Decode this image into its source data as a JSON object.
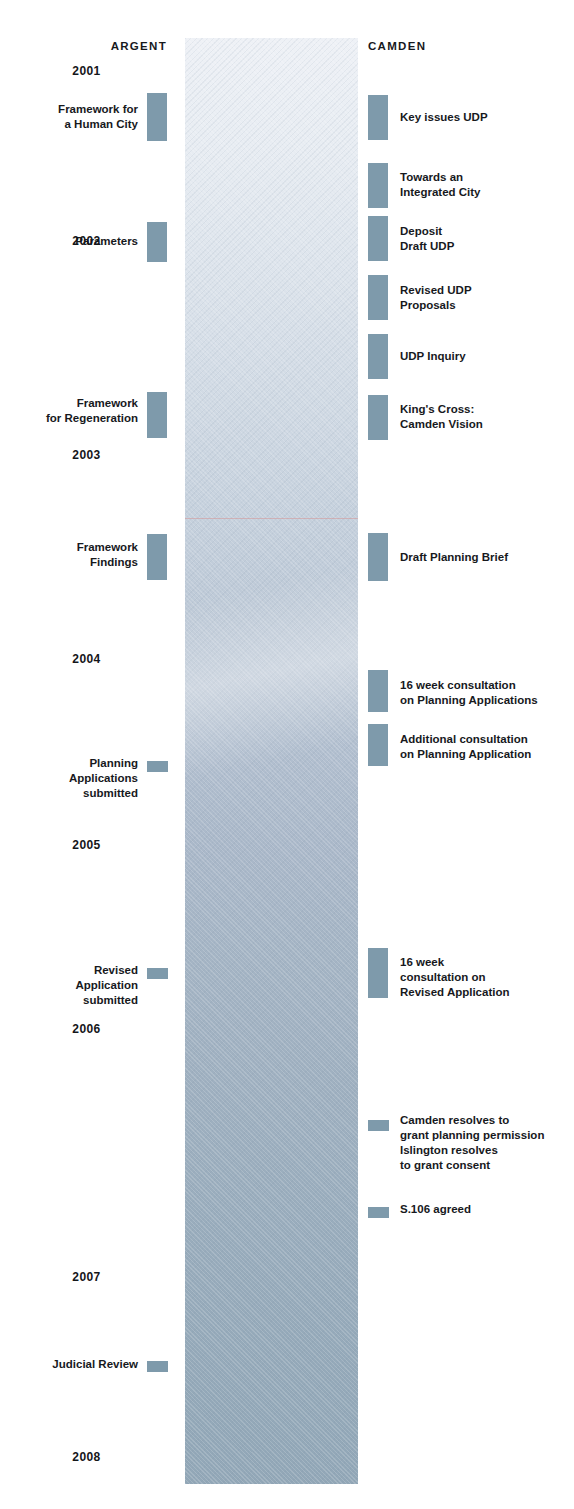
{
  "diagram": {
    "columns": {
      "left_heading": "ARGENT",
      "right_heading": "CAMDEN"
    },
    "colors": {
      "marker": "#7e9aab",
      "text": "#17191d",
      "column_top": "#eef1f6",
      "column_bottom": "#92a7b7",
      "scan_line": "#d69696"
    },
    "years": [
      {
        "label": "2001",
        "top": 64
      },
      {
        "label": "2002",
        "top": 234
      },
      {
        "label": "2003",
        "top": 448
      },
      {
        "label": "2004",
        "top": 652
      },
      {
        "label": "2005",
        "top": 838
      },
      {
        "label": "2006",
        "top": 1022
      },
      {
        "label": "2007",
        "top": 1270
      },
      {
        "label": "2008",
        "top": 1450
      }
    ],
    "argent_events": [
      {
        "label": "Framework for\na Human City",
        "marker_top": 93,
        "marker_height": 48,
        "label_top": 102,
        "size": "tall"
      },
      {
        "label": "Parameters",
        "marker_top": 222,
        "marker_height": 40,
        "label_top": 234,
        "size": "tall"
      },
      {
        "label": "Framework\nfor Regeneration",
        "marker_top": 392,
        "marker_height": 46,
        "label_top": 396,
        "size": "tall"
      },
      {
        "label": "Framework\nFindings",
        "marker_top": 534,
        "marker_height": 46,
        "label_top": 540,
        "size": "tall"
      },
      {
        "label": "Planning\nApplications\nsubmitted",
        "marker_top": 761,
        "marker_height": 11,
        "label_top": 756,
        "size": "short"
      },
      {
        "label": "Revised\nApplication\nsubmitted",
        "marker_top": 968,
        "marker_height": 11,
        "label_top": 963,
        "size": "short"
      },
      {
        "label": "Judicial Review",
        "marker_top": 1361,
        "marker_height": 11,
        "label_top": 1357,
        "size": "short"
      }
    ],
    "camden_events": [
      {
        "label": "Key issues UDP",
        "marker_top": 95,
        "marker_height": 45,
        "label_top": 110,
        "size": "tall"
      },
      {
        "label": "Towards an\nIntegrated City",
        "marker_top": 163,
        "marker_height": 45,
        "label_top": 170,
        "size": "tall"
      },
      {
        "label": "Deposit\nDraft UDP",
        "marker_top": 216,
        "marker_height": 45,
        "label_top": 224,
        "size": "tall"
      },
      {
        "label": "Revised UDP\nProposals",
        "marker_top": 275,
        "marker_height": 45,
        "label_top": 283,
        "size": "tall"
      },
      {
        "label": "UDP Inquiry",
        "marker_top": 334,
        "marker_height": 45,
        "label_top": 349,
        "size": "tall"
      },
      {
        "label": "King's Cross:\nCamden Vision",
        "marker_top": 395,
        "marker_height": 45,
        "label_top": 402,
        "size": "tall"
      },
      {
        "label": "Draft Planning Brief",
        "marker_top": 533,
        "marker_height": 48,
        "label_top": 550,
        "size": "tall"
      },
      {
        "label": "16 week consultation\non Planning Applications",
        "marker_top": 670,
        "marker_height": 42,
        "label_top": 678,
        "size": "tall"
      },
      {
        "label": "Additional consultation\non Planning Application",
        "marker_top": 724,
        "marker_height": 42,
        "label_top": 732,
        "size": "tall"
      },
      {
        "label": "16 week\nconsultation on\nRevised Application",
        "marker_top": 948,
        "marker_height": 50,
        "label_top": 955,
        "size": "tall"
      },
      {
        "label": "Camden resolves to\ngrant planning permission\nIslington resolves\nto grant consent",
        "marker_top": 1120,
        "marker_height": 11,
        "label_top": 1113,
        "size": "short"
      },
      {
        "label": "S.106 agreed",
        "marker_top": 1207,
        "marker_height": 11,
        "label_top": 1202,
        "size": "short"
      }
    ]
  }
}
